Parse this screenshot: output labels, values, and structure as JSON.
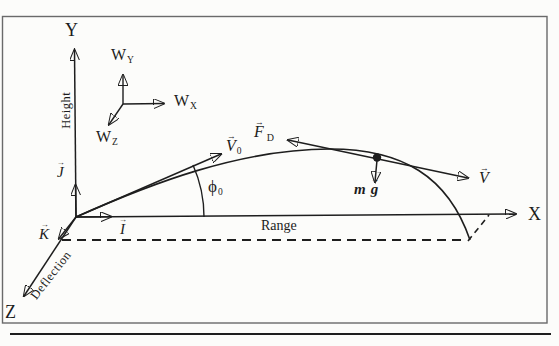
{
  "colors": {
    "ink": "#1e1e1e",
    "border": "#6a6a6a",
    "page_shadow": "#cfcfcb",
    "background": "#fcfcfa"
  },
  "glyphs": {
    "vector_arrow": "→"
  },
  "axes": {
    "y": {
      "label": "Y",
      "annotation": "Height"
    },
    "x": {
      "label": "X",
      "annotation": "Range"
    },
    "z": {
      "label": "Z",
      "annotation": "Deflection"
    }
  },
  "wind_triad": {
    "y": {
      "base": "W",
      "sub": "Y"
    },
    "x": {
      "base": "W",
      "sub": "X"
    },
    "z": {
      "base": "W",
      "sub": "Z"
    }
  },
  "unit_vectors": {
    "j": {
      "base": "J"
    },
    "i": {
      "base": "I"
    },
    "k": {
      "base": "K"
    }
  },
  "vectors": {
    "v0": {
      "base": "V",
      "sub": "0"
    },
    "v": {
      "base": "V"
    },
    "drag": {
      "base": "F",
      "sub": "D"
    },
    "gravity": {
      "m": "m",
      "g": "g"
    }
  },
  "angle": {
    "base": "ϕ",
    "sub": "0"
  }
}
